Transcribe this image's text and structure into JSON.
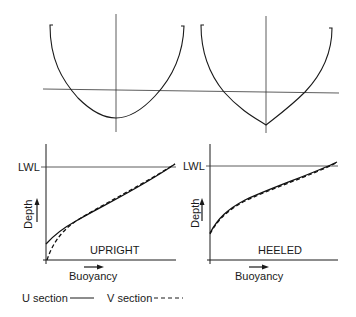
{
  "diagram": {
    "title": "",
    "sections": [
      {
        "id": "u-section",
        "name": "U section",
        "shape": "rounded U hull cross-section"
      },
      {
        "id": "v-section",
        "name": "V section",
        "shape": "pointed V hull cross-section"
      }
    ],
    "graphs": [
      {
        "id": "upright",
        "label": "UPRIGHT",
        "waterline_label": "LWL",
        "y_axis_label": "Depth",
        "x_axis_label": "Buoyancy",
        "note": "U section curve starts above origin; V section curve starts at origin; both converge at LWL"
      },
      {
        "id": "heeled",
        "label": "HEELED",
        "waterline_label": "LWL",
        "y_axis_label": "Depth",
        "x_axis_label": "Buoyancy",
        "note": "U and V section curves nearly coincide"
      }
    ],
    "legend": {
      "u_label": "U section",
      "u_style": "solid",
      "v_label": "V section",
      "v_style": "dashed"
    },
    "colors": {
      "ink": "#1a1a1a",
      "background": "#ffffff"
    }
  }
}
